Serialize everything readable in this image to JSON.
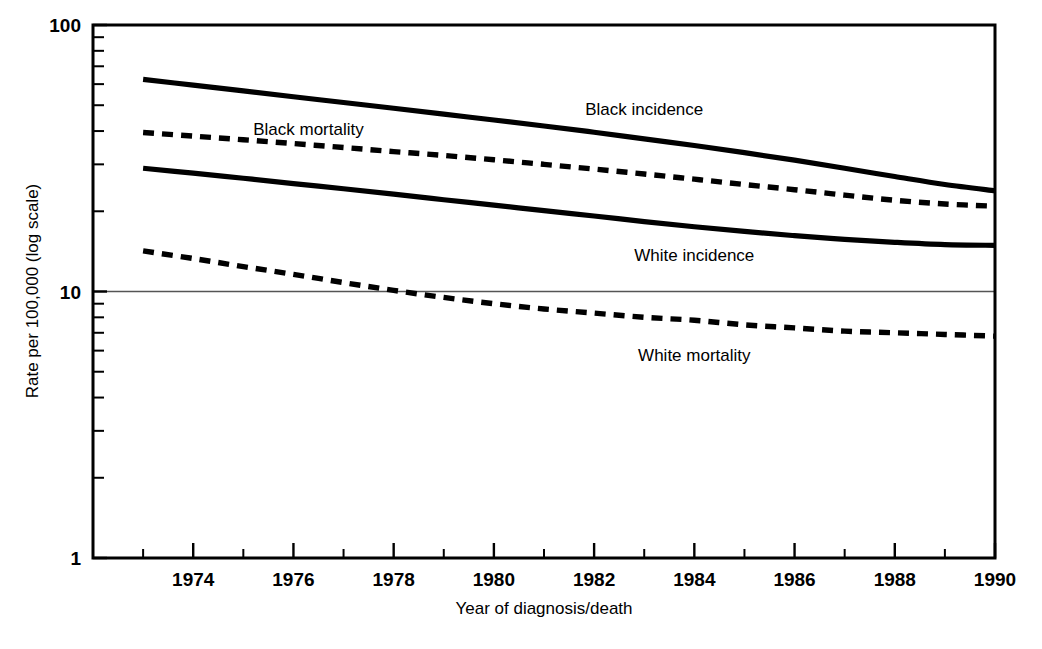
{
  "chart_data": {
    "type": "line",
    "title": "",
    "xlabel": "Year of diagnosis/death",
    "ylabel": "Rate per 100,000 (log scale)",
    "yscale": "log",
    "ylim": [
      1,
      100
    ],
    "xlim": [
      1972,
      1990
    ],
    "grid": "single horizontal gridline at y=10",
    "legend": "inline series labels",
    "y_major_ticks": [
      "1",
      "10",
      "100"
    ],
    "y_minor_ticks": [
      2,
      3,
      4,
      5,
      6,
      7,
      8,
      9,
      20,
      30,
      40,
      50,
      60,
      70,
      80,
      90
    ],
    "x_major_ticks": [
      1974,
      1976,
      1978,
      1980,
      1982,
      1984,
      1986,
      1988,
      1990
    ],
    "x_minor_ticks": [
      1973,
      1975,
      1977,
      1979,
      1981,
      1983,
      1985,
      1987,
      1989
    ],
    "x_tick_labels": [
      "1974",
      "1976",
      "1978",
      "1980",
      "1982",
      "1984",
      "1986",
      "1988",
      "1990"
    ],
    "x": [
      1973,
      1974,
      1975,
      1976,
      1977,
      1978,
      1979,
      1980,
      1981,
      1982,
      1983,
      1984,
      1985,
      1986,
      1987,
      1988,
      1989,
      1990
    ],
    "series": [
      {
        "name": "Black incidence",
        "style": "solid",
        "color": "#000000",
        "label_x": 1983.0,
        "label_y": 46.0,
        "values": [
          62.5,
          59.5,
          56.6,
          53.8,
          51.2,
          48.7,
          46.3,
          44.0,
          41.8,
          39.6,
          37.4,
          35.3,
          33.2,
          31.1,
          29.0,
          27.0,
          25.2,
          23.9
        ]
      },
      {
        "name": "Black mortality",
        "style": "dashed",
        "color": "#000000",
        "label_x": 1976.3,
        "label_y": 38.5,
        "values": [
          39.5,
          38.3,
          37.1,
          35.9,
          34.7,
          33.5,
          32.4,
          31.2,
          30.0,
          28.8,
          27.6,
          26.4,
          25.2,
          24.1,
          23.0,
          22.0,
          21.3,
          20.9
        ]
      },
      {
        "name": "White incidence",
        "style": "solid",
        "color": "#000000",
        "label_x": 1984.0,
        "label_y": 13.0,
        "values": [
          29.0,
          27.8,
          26.6,
          25.4,
          24.3,
          23.2,
          22.1,
          21.1,
          20.1,
          19.2,
          18.3,
          17.5,
          16.8,
          16.2,
          15.7,
          15.3,
          15.0,
          14.9
        ]
      },
      {
        "name": "White mortality",
        "style": "dashed",
        "color": "#000000",
        "label_x": 1984.0,
        "label_y": 5.5,
        "values": [
          14.2,
          13.3,
          12.4,
          11.6,
          10.8,
          10.1,
          9.5,
          9.0,
          8.6,
          8.3,
          8.0,
          7.8,
          7.5,
          7.3,
          7.1,
          7.0,
          6.9,
          6.8
        ]
      }
    ]
  }
}
